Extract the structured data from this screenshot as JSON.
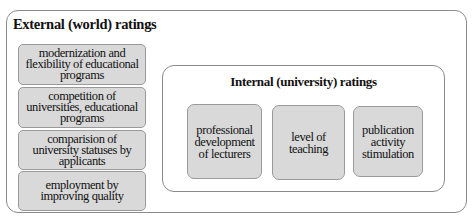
{
  "external": {
    "title": "External (world) ratings",
    "items": [
      {
        "label": "modernization and flexibility of educational programs"
      },
      {
        "label": "competition of universities, educational programs"
      },
      {
        "label": "comparision of university statuses by applicants"
      },
      {
        "label": "employment by improving quality"
      }
    ]
  },
  "internal": {
    "title": "Internal (university) ratings",
    "items": [
      {
        "label": "professional development of lecturers"
      },
      {
        "label": "level of teaching"
      },
      {
        "label": "publication activity stimulation"
      }
    ]
  },
  "colors": {
    "box_fill": "#d9d9d9",
    "border": "#8a8a8a",
    "background": "#ffffff"
  }
}
